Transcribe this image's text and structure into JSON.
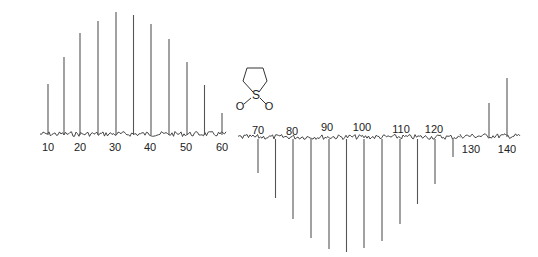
{
  "chart_data": {
    "type": "line",
    "title": "",
    "subtitle": "",
    "xlabel": "",
    "ylabel": "",
    "grid": false,
    "legend": null,
    "x_ticks_left": [
      10,
      20,
      30,
      40,
      50,
      60
    ],
    "x_ticks_middle": [
      70,
      80,
      90,
      100,
      110,
      120
    ],
    "x_ticks_right": [
      130,
      140
    ],
    "xlim": [
      7,
      143
    ],
    "series": [
      {
        "name": "positive peaks",
        "direction": "up",
        "x": [
          10,
          15,
          20,
          25,
          30,
          35,
          40,
          45,
          50,
          55,
          60,
          135,
          140
        ],
        "values": [
          51,
          78,
          102,
          114,
          123,
          120,
          111,
          96,
          73,
          50,
          22,
          34,
          59
        ]
      },
      {
        "name": "negative peaks",
        "direction": "down",
        "x": [
          70,
          75,
          80,
          85,
          90,
          95,
          100,
          105,
          110,
          115,
          120,
          125
        ],
        "values": [
          -34,
          -59,
          -80,
          -99,
          -110,
          -113,
          -109,
          -102,
          -85,
          -65,
          -45,
          -18
        ]
      }
    ],
    "annotations": [
      {
        "type": "structure",
        "label": "sulfolane",
        "atoms": [
          "S",
          "O",
          "O"
        ]
      }
    ]
  },
  "structure": {
    "sulfur_label": "S",
    "oxygen_left_label": "O",
    "oxygen_right_label": "O"
  },
  "axis_labels": {
    "t10": "10",
    "t20": "20",
    "t30": "30",
    "t40": "40",
    "t50": "50",
    "t60": "60",
    "t70": "70",
    "t80": "80",
    "t90": "90",
    "t100": "100",
    "t110": "110",
    "t120": "120",
    "t130": "130",
    "t140": "140"
  }
}
